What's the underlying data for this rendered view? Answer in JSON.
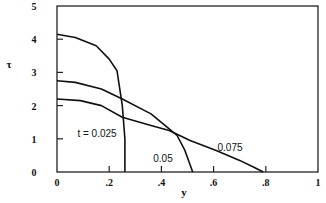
{
  "chart_data": {
    "type": "line",
    "title": "",
    "xlabel": "y",
    "ylabel": "τ",
    "xlim": [
      0,
      1
    ],
    "ylim": [
      0,
      5
    ],
    "grid": false,
    "legend": "inline labels",
    "x_ticks": [
      "0",
      ".2",
      ".4",
      ".6",
      ".8",
      "1"
    ],
    "y_ticks": [
      "0",
      "1",
      "2",
      "3",
      "4",
      "5"
    ],
    "series": [
      {
        "name": "t = 0.025",
        "label": "t = 0.025",
        "x": [
          0.0,
          0.07,
          0.15,
          0.2,
          0.23,
          0.25,
          0.26,
          0.26
        ],
        "y": [
          4.15,
          4.05,
          3.8,
          3.4,
          3.05,
          2.0,
          1.0,
          0.0
        ]
      },
      {
        "name": "t = 0.05",
        "label": "0.05",
        "x": [
          0.0,
          0.07,
          0.17,
          0.25,
          0.36,
          0.43,
          0.46,
          0.49,
          0.52
        ],
        "y": [
          2.75,
          2.7,
          2.5,
          2.2,
          1.75,
          1.3,
          1.1,
          0.65,
          0.0
        ]
      },
      {
        "name": "t = 0.075",
        "label": "0.075",
        "x": [
          0.0,
          0.09,
          0.17,
          0.25,
          0.36,
          0.43,
          0.51,
          0.61,
          0.7,
          0.76,
          0.79
        ],
        "y": [
          2.2,
          2.15,
          2.0,
          1.65,
          1.4,
          1.25,
          0.95,
          0.65,
          0.35,
          0.12,
          0.0
        ]
      }
    ],
    "annotations": [
      "t = 0.025",
      "0.05",
      "0.075"
    ]
  }
}
